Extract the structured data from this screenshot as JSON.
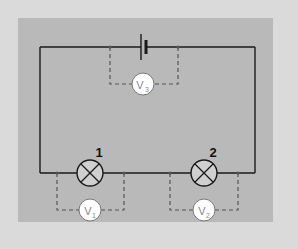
{
  "diagram": {
    "type": "series-circuit",
    "colors": {
      "outer_background": "#dadada",
      "panel_background": "#b9b9b9",
      "wire": "#1a1a1a",
      "dashed_lead": "#555555",
      "lamp_fill": "#d0d0d0",
      "voltmeter_fill": "#ffffff"
    },
    "components": {
      "battery": {
        "label": "",
        "icon": "battery-cell-icon"
      },
      "lamps": [
        {
          "id": "lamp-1",
          "label": "1",
          "icon": "lamp-icon"
        },
        {
          "id": "lamp-2",
          "label": "2",
          "icon": "lamp-icon"
        }
      ],
      "voltmeters": [
        {
          "id": "V1",
          "letter": "V",
          "subscript": "1",
          "across": "lamp-1"
        },
        {
          "id": "V2",
          "letter": "V",
          "subscript": "2",
          "across": "lamp-2"
        },
        {
          "id": "V3",
          "letter": "V",
          "subscript": "3",
          "across": "battery"
        }
      ]
    }
  }
}
